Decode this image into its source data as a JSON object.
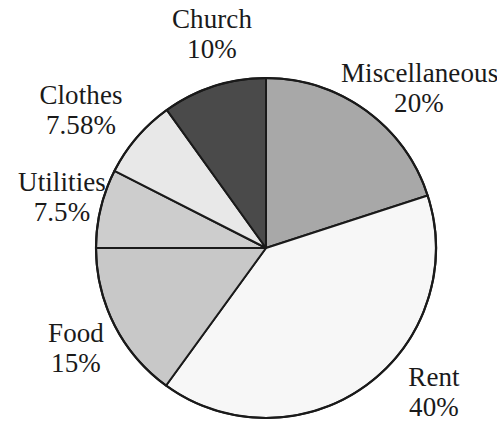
{
  "chart_data": {
    "type": "pie",
    "title": "",
    "subtitle": "",
    "xlabel": "",
    "ylabel": "",
    "legend_position": "none",
    "grid": false,
    "start_angle_deg": 0,
    "direction": "clockwise",
    "labels_outside": true,
    "categories": [
      "Miscellaneous",
      "Rent",
      "Food",
      "Utilities",
      "Clothes",
      "Church"
    ],
    "values": [
      20,
      40,
      15,
      7.5,
      7.58,
      10
    ],
    "value_unit": "%",
    "slices": [
      {
        "name": "Miscellaneous",
        "value": 20,
        "value_text": "20%",
        "color": "#a8a8a8",
        "start_deg": 0,
        "end_deg": 72
      },
      {
        "name": "Rent",
        "value": 40,
        "value_text": "40%",
        "color": "#f7f7f7",
        "start_deg": 72,
        "end_deg": 216
      },
      {
        "name": "Food",
        "value": 15,
        "value_text": "15%",
        "color": "#c8c8c8",
        "start_deg": 216,
        "end_deg": 270
      },
      {
        "name": "Utilities",
        "value": 7.5,
        "value_text": "7.5%",
        "color": "#cdcdcd",
        "start_deg": 270,
        "end_deg": 297
      },
      {
        "name": "Clothes",
        "value": 7.58,
        "value_text": "7.58%",
        "color": "#e8e8e8",
        "start_deg": 297,
        "end_deg": 324.3
      },
      {
        "name": "Church",
        "value": 10,
        "value_text": "10%",
        "color": "#4a4a4a",
        "start_deg": 324.3,
        "end_deg": 360
      }
    ],
    "outline_color": "#1a1a1a",
    "background_color": "#ffffff"
  },
  "labels": {
    "church": {
      "name": "Church",
      "value": "10%"
    },
    "miscellaneous": {
      "name": "Miscellaneous",
      "value": "20%"
    },
    "clothes": {
      "name": "Clothes",
      "value": "7.58%"
    },
    "utilities": {
      "name": "Utilities",
      "value": "7.5%"
    },
    "food": {
      "name": "Food",
      "value": "15%"
    },
    "rent": {
      "name": "Rent",
      "value": "40%"
    }
  }
}
